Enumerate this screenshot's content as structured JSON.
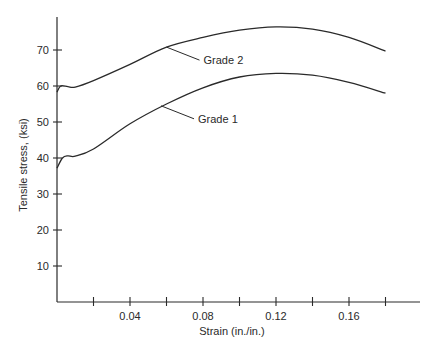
{
  "chart_data": {
    "type": "line",
    "title": "",
    "xlabel": "Strain (in./in.)",
    "ylabel": "Tensile stress, (ksi)",
    "xlim": [
      0,
      0.19
    ],
    "ylim": [
      0,
      78
    ],
    "grid": false,
    "legend_position": "inline labels with leader lines",
    "x_ticks": [
      0.02,
      0.04,
      0.06,
      0.08,
      0.1,
      0.12,
      0.14,
      0.16,
      0.18
    ],
    "x_tick_labels": [
      "",
      "0.04",
      "",
      "0.08",
      "",
      "0.12",
      "",
      "0.16",
      ""
    ],
    "y_ticks": [
      10,
      20,
      30,
      40,
      50,
      60,
      70
    ],
    "y_tick_labels": [
      "10",
      "20",
      "30",
      "40",
      "50",
      "60",
      "70"
    ],
    "series": [
      {
        "name": "Grade 2",
        "x": [
          0,
          0.002,
          0.006,
          0.01,
          0.02,
          0.04,
          0.06,
          0.08,
          0.1,
          0.12,
          0.14,
          0.16,
          0.18
        ],
        "values": [
          58.3,
          60,
          59.8,
          59.7,
          61.5,
          66,
          70.8,
          73.5,
          75.5,
          76.4,
          75.8,
          73.5,
          69.7
        ]
      },
      {
        "name": "Grade 1",
        "x": [
          0,
          0.003,
          0.006,
          0.01,
          0.02,
          0.04,
          0.06,
          0.08,
          0.1,
          0.12,
          0.14,
          0.16,
          0.18
        ],
        "values": [
          37.2,
          40,
          40.6,
          40.5,
          42.5,
          49.5,
          55,
          59.5,
          62.5,
          63.5,
          63,
          61,
          58
        ]
      }
    ],
    "annotations": [
      {
        "text": "Grade 2",
        "points_to_x": 0.06,
        "points_to_y": 70.8
      },
      {
        "text": "Grade 1",
        "points_to_x": 0.057,
        "points_to_y": 54.5
      }
    ]
  }
}
